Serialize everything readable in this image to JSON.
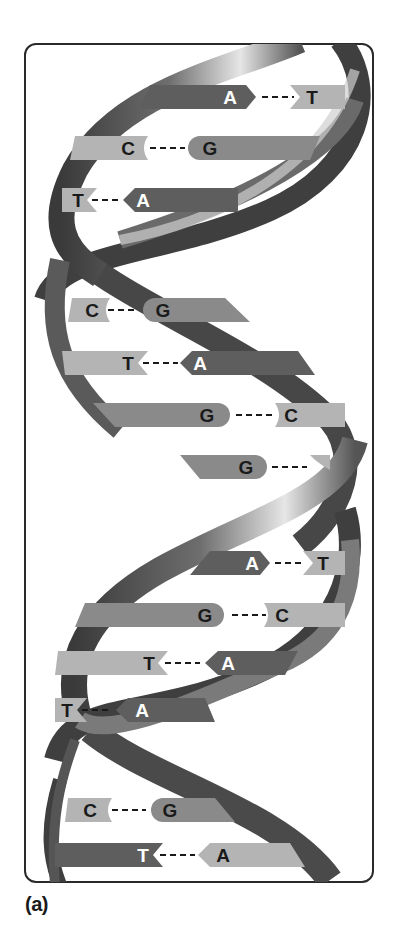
{
  "figure": {
    "caption": "(a)",
    "colors": {
      "frame": "#2a2a2a",
      "strand_dark": "#3c3c3c",
      "strand_mid": "#7a7a7a",
      "strand_light": "#d8d8d8",
      "base_dark": "#5e5e5e",
      "base_medium": "#8a8a8a",
      "base_light": "#b4b4b4",
      "text_dark": "#1a1a1a",
      "text_light": "#ffffff"
    }
  },
  "base_pairs": [
    {
      "left": "A",
      "right": "T",
      "y": 97
    },
    {
      "left": "C",
      "right": "G",
      "y": 148
    },
    {
      "left": "T",
      "right": "A",
      "y": 200
    },
    {
      "left": "C",
      "right": "G",
      "y": 310
    },
    {
      "left": "T",
      "right": "A",
      "y": 363
    },
    {
      "left": "G",
      "right": "C",
      "y": 415
    },
    {
      "left": "G",
      "right": "",
      "y": 467
    },
    {
      "left": "A",
      "right": "T",
      "y": 563
    },
    {
      "left": "G",
      "right": "C",
      "y": 615
    },
    {
      "left": "T",
      "right": "A",
      "y": 663
    },
    {
      "left": "T",
      "right": "A",
      "y": 710
    },
    {
      "left": "C",
      "right": "G",
      "y": 810
    },
    {
      "left": "T",
      "right": "A",
      "y": 855
    }
  ]
}
